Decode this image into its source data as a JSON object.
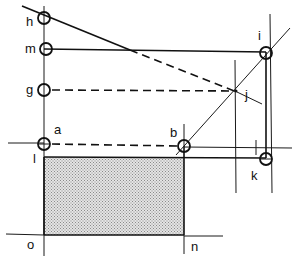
{
  "diagram": {
    "type": "geometric-construction",
    "fill_color": "#c8c8c8",
    "line_color": "#111111",
    "points": {
      "h": {
        "label": "h",
        "marker": "circle"
      },
      "m": {
        "label": "m",
        "marker": "circle"
      },
      "g": {
        "label": "g",
        "marker": "circle"
      },
      "a": {
        "label": "a",
        "marker": "circle"
      },
      "i": {
        "label": "i",
        "marker": "circle"
      },
      "j": {
        "label": "j",
        "marker": "intersection"
      },
      "b": {
        "label": "b",
        "marker": "circle"
      },
      "k": {
        "label": "k",
        "marker": "circle"
      },
      "l": {
        "label": "l",
        "marker": "none"
      },
      "o": {
        "label": "o",
        "marker": "none"
      },
      "n": {
        "label": "n",
        "marker": "none"
      }
    },
    "segments": [
      {
        "from": "h",
        "to": "j",
        "style": "solid-then-dashed"
      },
      {
        "from": "m",
        "to": "i",
        "style": "solid"
      },
      {
        "from": "g",
        "to": "j",
        "style": "dashed"
      },
      {
        "from": "a",
        "to": "b",
        "style": "dashed"
      },
      {
        "from": "b",
        "to": "i",
        "style": "thin-diagonal"
      },
      {
        "from": "i",
        "to": "k",
        "style": "solid"
      },
      {
        "from": "l",
        "to": "k",
        "style": "solid"
      },
      {
        "from": "o",
        "to": "n",
        "style": "solid"
      }
    ],
    "shaded_region": {
      "corners": [
        "l",
        "b",
        "n",
        "o"
      ]
    }
  }
}
